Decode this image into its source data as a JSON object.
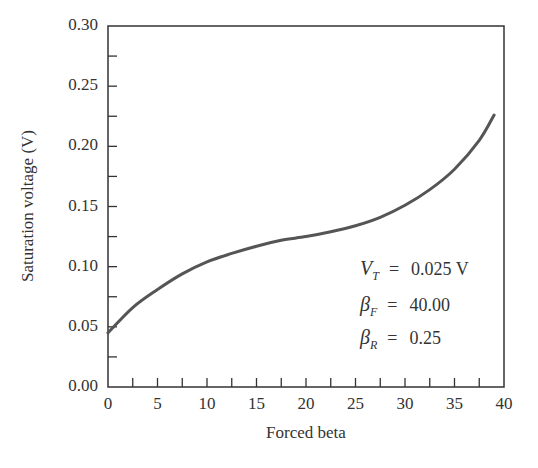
{
  "chart_data": {
    "type": "line",
    "title": "",
    "xlabel": "Forced beta",
    "ylabel": "Saturation voltage (V)",
    "xlim": [
      0,
      40
    ],
    "ylim": [
      0,
      0.3
    ],
    "xticks": [
      "0",
      "5",
      "10",
      "15",
      "20",
      "25",
      "30",
      "35",
      "40"
    ],
    "yticks": [
      "0.00",
      "0.05",
      "0.10",
      "0.15",
      "0.20",
      "0.25",
      "0.30"
    ],
    "grid": false,
    "series": [
      {
        "name": "V_CE,sat",
        "x": [
          0,
          2.5,
          5,
          7.5,
          10,
          12.5,
          15,
          17.5,
          20,
          22.5,
          25,
          27.5,
          30,
          32.5,
          35,
          37.5,
          39
        ],
        "y": [
          0.045,
          0.066,
          0.081,
          0.094,
          0.104,
          0.111,
          0.117,
          0.122,
          0.125,
          0.129,
          0.134,
          0.141,
          0.151,
          0.164,
          0.181,
          0.205,
          0.226
        ]
      }
    ],
    "annotations": [
      {
        "symbol": "V",
        "sub": "T",
        "value": "0.025 V"
      },
      {
        "symbol": "β",
        "sub": "F",
        "value": "40.00"
      },
      {
        "symbol": "β",
        "sub": "R",
        "value": "0.25"
      }
    ]
  }
}
